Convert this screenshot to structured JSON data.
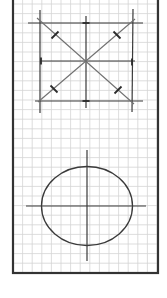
{
  "diagram": {
    "title": "",
    "colors": {
      "background": "#ffffff",
      "grid": "#d4d4d4",
      "border": "#333333",
      "ink": "#3a3a3a",
      "diagonal": "#707070"
    },
    "frame": {
      "x": 13,
      "y": 0,
      "width": 145,
      "height": 273
    },
    "grid_spacing": 9.6,
    "top_figure": {
      "horizontals": [
        {
          "x1": 28,
          "y1": 23,
          "x2": 143,
          "y2": 23
        },
        {
          "x1": 40,
          "y1": 61,
          "x2": 135,
          "y2": 61
        },
        {
          "x1": 35,
          "y1": 101,
          "x2": 143,
          "y2": 101
        }
      ],
      "verticals": [
        {
          "x1": 40,
          "y1": 10,
          "x2": 40,
          "y2": 113
        },
        {
          "x1": 86,
          "y1": 16,
          "x2": 86,
          "y2": 108
        },
        {
          "x1": 133,
          "y1": 9,
          "x2": 132,
          "y2": 112
        }
      ],
      "diagonals": [
        {
          "x1": 37,
          "y1": 18,
          "x2": 134,
          "y2": 104
        },
        {
          "x1": 38,
          "y1": 102,
          "x2": 135,
          "y2": 19
        }
      ],
      "ticks": [
        {
          "cx": 55,
          "cy": 35
        },
        {
          "cx": 117,
          "cy": 35
        },
        {
          "cx": 54,
          "cy": 89
        },
        {
          "cx": 118,
          "cy": 90
        },
        {
          "cx": 86,
          "cy": 23
        },
        {
          "cx": 86,
          "cy": 101
        },
        {
          "cx": 41,
          "cy": 61
        },
        {
          "cx": 132,
          "cy": 62
        }
      ]
    },
    "bottom_figure": {
      "ellipse": {
        "cx": 87,
        "cy": 206,
        "rx": 45.5,
        "ry": 39.5
      },
      "h_axis": {
        "x1": 26,
        "y1": 206,
        "x2": 146,
        "y2": 206
      },
      "v_axis": {
        "x1": 87,
        "y1": 150,
        "x2": 87,
        "y2": 261
      }
    }
  }
}
